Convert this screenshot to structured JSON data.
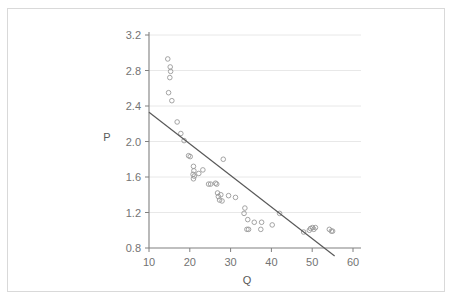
{
  "top_clip_text": "",
  "chart_data": {
    "type": "scatter",
    "title": "",
    "xlabel": "Q",
    "ylabel": "P",
    "xlim": [
      10,
      60
    ],
    "ylim": [
      0.8,
      3.2
    ],
    "xticks": [
      10,
      20,
      30,
      40,
      50,
      60
    ],
    "yticks": [
      0.8,
      1.2,
      1.6,
      2.0,
      2.4,
      2.8,
      3.2
    ],
    "xtick_labels": [
      "10",
      "20",
      "30",
      "40",
      "50",
      "60"
    ],
    "ytick_labels": [
      "0.8",
      "1.2",
      "1.6",
      "2.0",
      "2.4",
      "2.8",
      "3.2"
    ],
    "grid": "horizontal",
    "legend": "none",
    "marker": "open-circle",
    "marker_color": "#9a9a9a",
    "line_color": "#595959",
    "grid_color": "#e8e8e8",
    "axis_color": "#808080",
    "series": [
      {
        "name": "observations",
        "points": [
          [
            14.6,
            2.93
          ],
          [
            15.2,
            2.84
          ],
          [
            15.3,
            2.79
          ],
          [
            15.1,
            2.72
          ],
          [
            14.8,
            2.55
          ],
          [
            15.6,
            2.46
          ],
          [
            16.9,
            2.22
          ],
          [
            17.8,
            2.09
          ],
          [
            18.6,
            2.01
          ],
          [
            19.7,
            1.84
          ],
          [
            20.1,
            1.83
          ],
          [
            20.9,
            1.72
          ],
          [
            21.0,
            1.67
          ],
          [
            20.8,
            1.63
          ],
          [
            21.1,
            1.61
          ],
          [
            22.2,
            1.64
          ],
          [
            23.2,
            1.68
          ],
          [
            20.9,
            1.58
          ],
          [
            24.6,
            1.52
          ],
          [
            25.1,
            1.52
          ],
          [
            26.3,
            1.53
          ],
          [
            26.6,
            1.52
          ],
          [
            28.2,
            1.8
          ],
          [
            26.8,
            1.42
          ],
          [
            27.0,
            1.38
          ],
          [
            27.6,
            1.4
          ],
          [
            27.3,
            1.34
          ],
          [
            27.9,
            1.33
          ],
          [
            29.5,
            1.39
          ],
          [
            31.2,
            1.37
          ],
          [
            33.5,
            1.25
          ],
          [
            33.3,
            1.19
          ],
          [
            34.2,
            1.12
          ],
          [
            34.0,
            1.01
          ],
          [
            34.4,
            1.01
          ],
          [
            35.8,
            1.09
          ],
          [
            37.6,
            1.09
          ],
          [
            37.4,
            1.01
          ],
          [
            40.2,
            1.06
          ],
          [
            42.0,
            1.19
          ],
          [
            47.9,
            0.98
          ],
          [
            49.3,
            1.0
          ],
          [
            49.6,
            1.02
          ],
          [
            50.1,
            1.03
          ],
          [
            50.4,
            1.01
          ],
          [
            50.8,
            1.03
          ],
          [
            54.2,
            1.01
          ],
          [
            54.7,
            0.99
          ],
          [
            55.0,
            0.99
          ]
        ]
      }
    ],
    "trendline": {
      "name": "fitted-line",
      "x_start": 10.0,
      "y_start": 2.33,
      "x_end": 55.5,
      "y_end": 0.71
    }
  }
}
